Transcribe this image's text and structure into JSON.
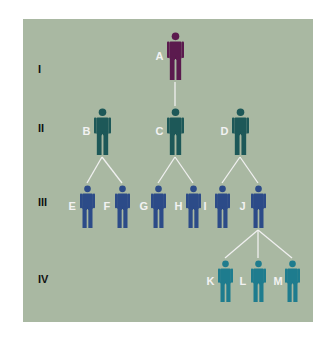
{
  "diagram": {
    "type": "pedigree",
    "generations": [
      {
        "label": "I",
        "y": 70
      },
      {
        "label": "II",
        "y": 129
      },
      {
        "label": "III",
        "y": 203
      },
      {
        "label": "IV",
        "y": 280
      }
    ],
    "colors": {
      "panel": "#a9b8a2",
      "lines": "#f0f0f0",
      "gen1": "#5b1a4e",
      "gen2": "#1d5858",
      "gen3": "#2c4b88",
      "gen4": "#1e7c8e",
      "label": "#f2f2f2"
    },
    "people": [
      {
        "id": "A",
        "gen": 1,
        "x": 175,
        "top": 32,
        "h": 48
      },
      {
        "id": "B",
        "gen": 2,
        "x": 102,
        "top": 108,
        "h": 47
      },
      {
        "id": "C",
        "gen": 2,
        "x": 175,
        "top": 108,
        "h": 47
      },
      {
        "id": "D",
        "gen": 2,
        "x": 240,
        "top": 108,
        "h": 47
      },
      {
        "id": "E",
        "gen": 3,
        "x": 87,
        "top": 185,
        "h": 43
      },
      {
        "id": "F",
        "gen": 3,
        "x": 122,
        "top": 185,
        "h": 43
      },
      {
        "id": "G",
        "gen": 3,
        "x": 158,
        "top": 185,
        "h": 43
      },
      {
        "id": "H",
        "gen": 3,
        "x": 193,
        "top": 185,
        "h": 43
      },
      {
        "id": "I",
        "gen": 3,
        "x": 222,
        "top": 185,
        "h": 43
      },
      {
        "id": "J",
        "gen": 3,
        "x": 258,
        "top": 185,
        "h": 43
      },
      {
        "id": "K",
        "gen": 4,
        "x": 225,
        "top": 260,
        "h": 42
      },
      {
        "id": "L",
        "gen": 4,
        "x": 258,
        "top": 260,
        "h": 42
      },
      {
        "id": "M",
        "gen": 4,
        "x": 292,
        "top": 260,
        "h": 42
      }
    ],
    "edges": [
      [
        "A",
        "C"
      ],
      [
        "B",
        "E"
      ],
      [
        "B",
        "F"
      ],
      [
        "C",
        "G"
      ],
      [
        "C",
        "H"
      ],
      [
        "D",
        "I"
      ],
      [
        "D",
        "J"
      ],
      [
        "J",
        "K"
      ],
      [
        "J",
        "L"
      ],
      [
        "J",
        "M"
      ]
    ]
  }
}
